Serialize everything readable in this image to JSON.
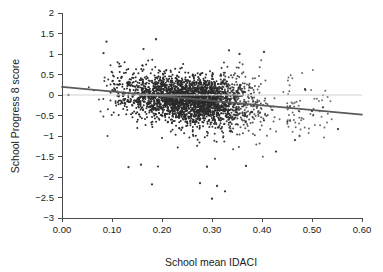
{
  "chart_data": {
    "type": "scatter",
    "title": "",
    "xlabel": "School mean IDACI",
    "ylabel": "School Progress 8 score",
    "xlim": [
      0.0,
      0.6
    ],
    "ylim": [
      -3,
      2
    ],
    "grid": false,
    "legend": null,
    "x_ticks": [
      "0.00",
      "0.10",
      "0.20",
      "0.30",
      "0.40",
      "0.50",
      "0.60"
    ],
    "x_tick_values": [
      0.0,
      0.1,
      0.2,
      0.3,
      0.4,
      0.5,
      0.6
    ],
    "y_ticks": [
      "2",
      "1.5",
      "1",
      "0.5",
      "0",
      "-0.5",
      "-1",
      "-1.5",
      "-2",
      "-2.5",
      "-3"
    ],
    "y_tick_values": [
      2,
      1.5,
      1,
      0.5,
      0,
      -0.5,
      -1,
      -1.5,
      -2,
      -2.5,
      -3
    ],
    "marker": {
      "shape": "circle",
      "color": "#2b2b2b",
      "size_px": 2.0,
      "count": 2850
    },
    "annotations": [
      {
        "name": "regression-line",
        "kind": "line",
        "description": "Fitted linear regression of School Progress 8 score on School mean IDACI",
        "color": "#5a5a5a",
        "intercept": 0.2,
        "slope": -1.13,
        "x_start": 0.0,
        "y_start": 0.2,
        "x_end": 0.6,
        "y_end": -0.48
      },
      {
        "name": "zero-reference-line",
        "kind": "hline",
        "description": "Horizontal reference line at Progress 8 score = 0",
        "color": "#d2d2d2",
        "y": 0,
        "x_start": 0.0,
        "x_end": 0.6
      }
    ],
    "series": [
      {
        "name": "Schools",
        "description": "Each point is one school: mean IDACI deprivation index vs Progress 8 score",
        "n_points": 2850,
        "x_range_observed": [
          0.012,
          0.552
        ],
        "y_range_observed": [
          -2.53,
          1.36
        ],
        "cloud": {
          "core_x_min": 0.04,
          "core_x_max": 0.45,
          "x_mode": 0.2,
          "y_center_at_x_min": 0.15,
          "y_center_at_x_max": -0.3,
          "y_spread_sd": 0.33
        },
        "notable_points": [
          {
            "x": 0.013,
            "y": 0.0
          },
          {
            "x": 0.089,
            "y": 1.3
          },
          {
            "x": 0.188,
            "y": 1.36
          },
          {
            "x": 0.163,
            "y": 1.12
          },
          {
            "x": 0.083,
            "y": 1.02
          },
          {
            "x": 0.334,
            "y": 1.09
          },
          {
            "x": 0.355,
            "y": 1.0
          },
          {
            "x": 0.404,
            "y": 1.05
          },
          {
            "x": 0.133,
            "y": -1.76
          },
          {
            "x": 0.158,
            "y": -1.7
          },
          {
            "x": 0.18,
            "y": -2.18
          },
          {
            "x": 0.276,
            "y": -2.15
          },
          {
            "x": 0.3,
            "y": -2.53
          },
          {
            "x": 0.31,
            "y": -2.22
          },
          {
            "x": 0.326,
            "y": -2.35
          },
          {
            "x": 0.29,
            "y": -1.75
          },
          {
            "x": 0.368,
            "y": -1.73
          },
          {
            "x": 0.428,
            "y": -1.38
          },
          {
            "x": 0.466,
            "y": -1.1
          },
          {
            "x": 0.522,
            "y": -0.3
          },
          {
            "x": 0.5,
            "y": -0.39
          },
          {
            "x": 0.486,
            "y": 0.14
          },
          {
            "x": 0.552,
            "y": -0.83
          }
        ]
      }
    ]
  }
}
